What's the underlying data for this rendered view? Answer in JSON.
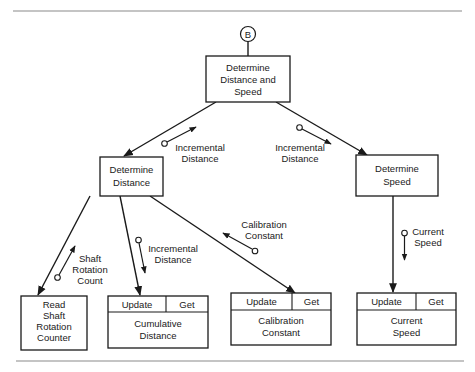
{
  "connector": {
    "label": "B"
  },
  "modules": {
    "root": {
      "lines": [
        "Determine",
        "Distance and",
        "Speed"
      ]
    },
    "determine_distance": {
      "lines": [
        "Determine",
        "Distance"
      ]
    },
    "determine_speed": {
      "lines": [
        "Determine",
        "Speed"
      ]
    },
    "read_shaft": {
      "lines": [
        "Read",
        "Shaft",
        "Rotation",
        "Counter"
      ]
    }
  },
  "data_objects": {
    "cumulative_distance": {
      "ops": [
        "Update",
        "Get"
      ],
      "lines": [
        "Cumulative",
        "Distance"
      ]
    },
    "calibration_constant": {
      "ops": [
        "Update",
        "Get"
      ],
      "lines": [
        "Calibration",
        "Constant"
      ]
    },
    "current_speed": {
      "ops": [
        "Update",
        "Get"
      ],
      "lines": [
        "Current",
        "Speed"
      ]
    }
  },
  "couples": {
    "root_to_distance": {
      "lines": [
        "Incremental",
        "Distance"
      ]
    },
    "root_to_speed": {
      "lines": [
        "Incremental",
        "Distance"
      ]
    },
    "shaft_count": {
      "lines": [
        "Shaft",
        "Rotation",
        "Count"
      ]
    },
    "to_cumulative": {
      "lines": [
        "Incremental",
        "Distance"
      ]
    },
    "calibration": {
      "lines": [
        "Calibration",
        "Constant"
      ]
    },
    "current_speed": {
      "lines": [
        "Current",
        "Speed"
      ]
    }
  }
}
